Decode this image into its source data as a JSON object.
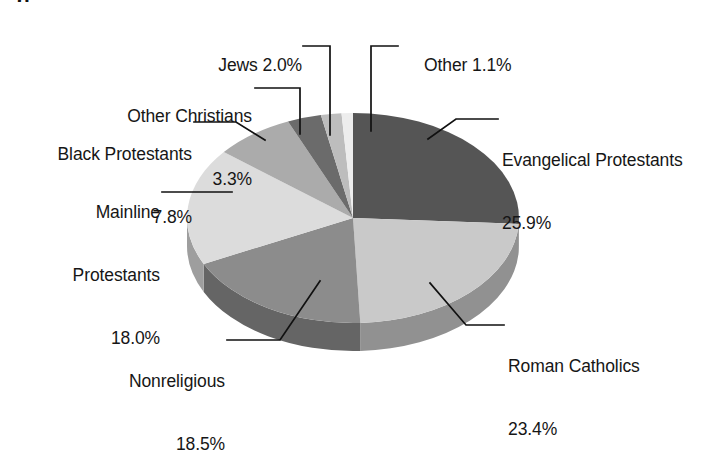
{
  "figure": {
    "caption_fragment": "g",
    "background": "#ffffff"
  },
  "chart_data": {
    "type": "pie",
    "title": "",
    "subtitle": "",
    "xlabel": "",
    "ylabel": "",
    "three_d": true,
    "start_angle_deg": 0,
    "direction": "clockwise",
    "legend_position": "none",
    "labels_position": "outside-with-leader-lines",
    "units": "percent",
    "total": 100.0,
    "categories": [
      "Evangelical Protestants",
      "Roman Catholics",
      "Nonreligious",
      "Mainline Protestants",
      "Black Protestants",
      "Other Christians",
      "Jews",
      "Other"
    ],
    "values": [
      25.9,
      23.4,
      18.5,
      18.0,
      7.8,
      3.3,
      2.0,
      1.1
    ],
    "colors": [
      "#555555",
      "#c9c9c9",
      "#8c8c8c",
      "#dcdcdc",
      "#ababab",
      "#6b6b6b",
      "#bdbdbd",
      "#ededed"
    ],
    "slices": [
      {
        "name": "Evangelical Protestants",
        "value": 25.9,
        "label": "Evangelical Protestants",
        "percent": "25.9%",
        "color": "#555555"
      },
      {
        "name": "Roman Catholics",
        "value": 23.4,
        "label": "Roman Catholics",
        "percent": "23.4%",
        "color": "#c9c9c9"
      },
      {
        "name": "Nonreligious",
        "value": 18.5,
        "label": "Nonreligious",
        "percent": "18.5%",
        "color": "#8c8c8c"
      },
      {
        "name": "Mainline Protestants",
        "value": 18.0,
        "label": "Mainline\nProtestants",
        "percent": "18.0%",
        "color": "#dcdcdc"
      },
      {
        "name": "Black Protestants",
        "value": 7.8,
        "label": "Black Protestants",
        "percent": "7.8%",
        "color": "#ababab"
      },
      {
        "name": "Other Christians",
        "value": 3.3,
        "label": "Other Christians",
        "percent": "3.3%",
        "color": "#6b6b6b"
      },
      {
        "name": "Jews",
        "value": 2.0,
        "label": "Jews",
        "percent": "2.0%",
        "color": "#bdbdbd"
      },
      {
        "name": "Other",
        "value": 1.1,
        "label": "Other",
        "percent": "1.1%",
        "color": "#ededed"
      }
    ]
  },
  "labels": {
    "jews": "Jews 2.0%",
    "other": "Other 1.1%",
    "other_christians_name": "Other Christians",
    "other_christians_pct": "3.3%",
    "black_protestants_name": "Black Protestants",
    "black_protestants_pct": "7.8%",
    "mainline_name_1": "Mainline",
    "mainline_name_2": "Protestants",
    "mainline_pct": "18.0%",
    "nonreligious_name": "Nonreligious",
    "nonreligious_pct": "18.5%",
    "evangelical_name": "Evangelical Protestants",
    "evangelical_pct": "25.9%",
    "roman_name": "Roman Catholics",
    "roman_pct": "23.4%"
  }
}
